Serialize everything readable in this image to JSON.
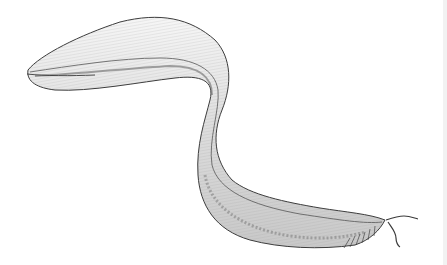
{
  "image": {
    "subject": "worm-like larva illustration",
    "style": "pen-and-ink scientific drawing",
    "background_color": "#ffffff",
    "ink_color": "#3a3a3a",
    "body_fill": "#e9e9e9",
    "shade_color": "#8a8a8a"
  }
}
